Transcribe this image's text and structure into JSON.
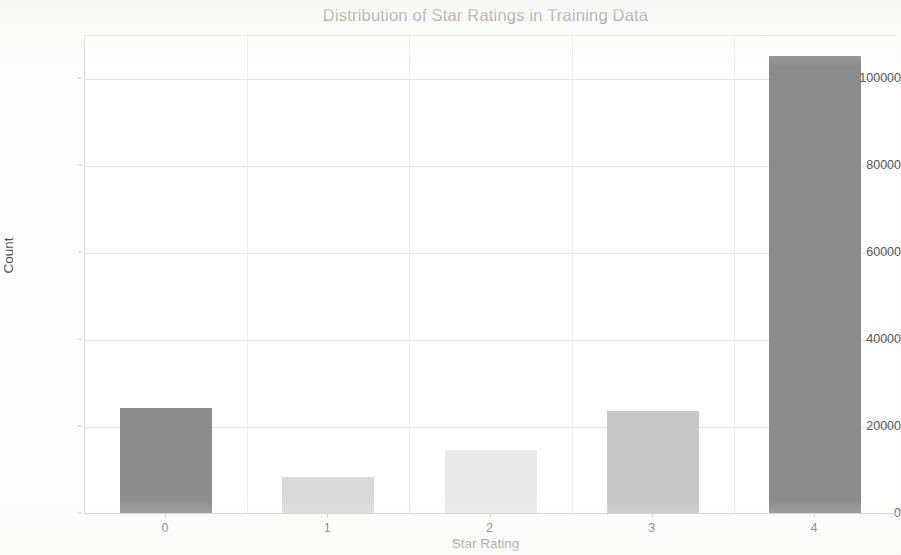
{
  "chart_data": {
    "type": "bar",
    "title": "Distribution of Star Ratings in Training Data",
    "xlabel": "Star Rating",
    "ylabel": "Count",
    "categories": [
      "0",
      "1",
      "2",
      "3",
      "4"
    ],
    "values": [
      24400,
      8600,
      14800,
      23700,
      105500
    ],
    "ylim": [
      0,
      110000
    ],
    "yticks": [
      0,
      20000,
      40000,
      60000,
      80000,
      100000
    ],
    "ytick_labels": [
      "0",
      "20000",
      "40000",
      "60000",
      "80000",
      "100000"
    ],
    "xtick_labels": [
      "0",
      "1",
      "2",
      "3",
      "4"
    ],
    "grid": true,
    "legend": null,
    "bar_colors": [
      "#8d8d8d",
      "#d9d9d9",
      "#e9e9e9",
      "#c6c6c6",
      "#8b8b8b"
    ],
    "background_color": "#ffffff",
    "grid_color": "#e4e4e4",
    "axis_text_color": "#555555"
  }
}
